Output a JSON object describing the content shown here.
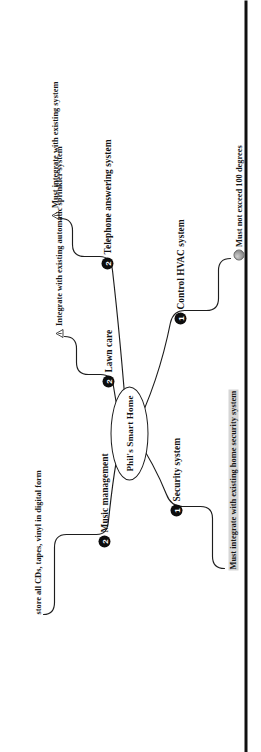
{
  "diagram": {
    "type": "mind-map",
    "orientation": "rotated-90",
    "center": {
      "label": "Phil's Smart Home"
    },
    "branches": [
      {
        "id": "music-management",
        "label": "Music management",
        "badge": "2",
        "notes": [
          {
            "id": "store-media",
            "text": "store all CDs, tapes, vinyl in digital form",
            "icon": "none",
            "highlight": false
          }
        ]
      },
      {
        "id": "lawn-care",
        "label": "Lawn care",
        "badge": "2",
        "notes": [
          {
            "id": "sprinkler-integration",
            "text": "Integrate with existing automatic sprinkler system",
            "icon": "warning-icon",
            "highlight": false
          }
        ]
      },
      {
        "id": "telephone-answering-system",
        "label": "Telephone answering system",
        "badge": "2",
        "notes": [
          {
            "id": "must-integrate-existing",
            "text": "Must integrate with existing system",
            "icon": "warning-icon",
            "highlight": false
          }
        ]
      },
      {
        "id": "security-system",
        "label": "Security system",
        "badge": "1",
        "notes": [
          {
            "id": "home-security-integration",
            "text": "Must integrate with existing home security system",
            "icon": "none",
            "highlight": true
          }
        ]
      },
      {
        "id": "control-hvac-system",
        "label": "Control HVAC system",
        "badge": "1",
        "notes": [
          {
            "id": "temperature-limit",
            "text": "Must not exceed 100 degrees",
            "icon": "sphere-icon",
            "highlight": false
          }
        ]
      }
    ],
    "colors": {
      "ink": "#111111",
      "badge_fill": "#0d0d0d",
      "badge_text": "#ffffff",
      "highlight": "#d6d6d6",
      "paper": "#ffffff",
      "rule": "#101010"
    }
  }
}
